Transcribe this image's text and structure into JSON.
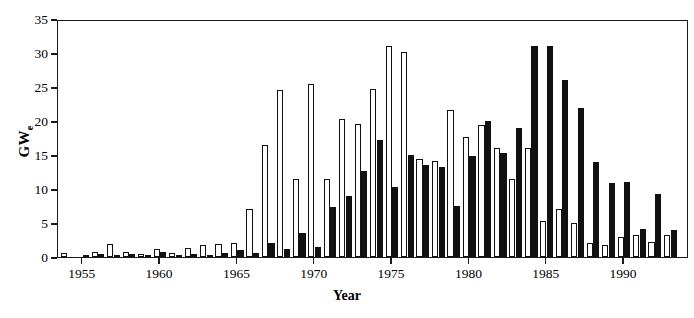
{
  "chart_data": {
    "type": "bar",
    "title": "",
    "subtitle": "",
    "xlabel": "Year",
    "ylabel": "GWe",
    "ylabel_base": "GW",
    "ylabel_sub": "e",
    "xlim": [
      1953.4,
      1994.2
    ],
    "ylim": [
      0,
      35
    ],
    "yticks": [
      0,
      5,
      10,
      15,
      20,
      25,
      30,
      35
    ],
    "ytick_labels": [
      "0",
      "5",
      "10",
      "15",
      "20",
      "25",
      "30",
      "35"
    ],
    "xticks": [
      1955,
      1960,
      1965,
      1970,
      1975,
      1980,
      1985,
      1990
    ],
    "xtick_labels": [
      "1955",
      "1960",
      "1965",
      "1970",
      "1975",
      "1980",
      "1985",
      "1990"
    ],
    "grid": false,
    "legend": "none",
    "bar_colors": {
      "open": "#ffffff",
      "filled": "#111111",
      "outline": "#111111"
    },
    "categories": [
      1954,
      1955,
      1956,
      1957,
      1958,
      1959,
      1960,
      1961,
      1962,
      1963,
      1964,
      1965,
      1966,
      1967,
      1968,
      1969,
      1970,
      1971,
      1972,
      1973,
      1974,
      1975,
      1976,
      1977,
      1978,
      1979,
      1980,
      1981,
      1982,
      1983,
      1984,
      1985,
      1986,
      1987,
      1988,
      1989,
      1990,
      1991,
      1992,
      1993
    ],
    "series": [
      {
        "name": "Construction starts",
        "style": "open",
        "values": [
          0.6,
          0.0,
          0.7,
          1.9,
          0.7,
          0.5,
          1.2,
          0.6,
          1.3,
          1.8,
          1.9,
          2.0,
          7.1,
          16.4,
          24.6,
          11.4,
          25.4,
          11.4,
          20.3,
          19.6,
          24.7,
          31.1,
          30.1,
          14.4,
          14.1,
          21.6,
          17.6,
          19.4,
          16.1,
          11.5,
          16.0,
          5.3,
          7.0,
          5.0,
          2.0,
          1.8,
          2.9,
          3.3,
          2.2,
          3.2
        ]
      },
      {
        "name": "Grid connections",
        "style": "filled",
        "values": [
          0.0,
          0.3,
          0.4,
          0.3,
          0.4,
          0.3,
          0.7,
          0.3,
          0.5,
          0.3,
          0.6,
          1.0,
          0.6,
          2.0,
          1.2,
          3.6,
          1.4,
          7.4,
          8.9,
          12.7,
          17.2,
          10.3,
          15.0,
          13.6,
          13.3,
          7.5,
          14.9,
          20.0,
          15.3,
          18.9,
          31.0,
          31.0,
          26.1,
          21.9,
          14.0,
          10.9,
          11.0,
          4.1,
          9.3,
          4.0
        ]
      }
    ]
  },
  "axis": {
    "y_title_base": "GW",
    "y_title_sub": "e",
    "x_title": "Year"
  }
}
